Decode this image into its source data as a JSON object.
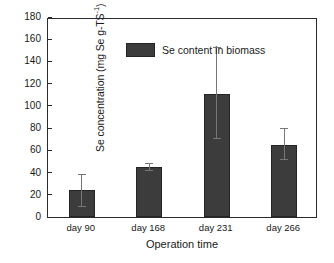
{
  "chart_data": {
    "type": "bar",
    "title": "",
    "xlabel": "Operation time",
    "ylabel": "Se concentration (mg Se g-TS",
    "ylabel_sup": "-1",
    "ylabel_tail": ")",
    "categories": [
      "day 90",
      "day 168",
      "day 231",
      "day 266"
    ],
    "series": [
      {
        "name": "Se content in biomass",
        "values": [
          24,
          45,
          111,
          65
        ],
        "err_low": [
          9,
          41,
          70,
          51
        ],
        "err_high": [
          39,
          49,
          153,
          80
        ]
      }
    ],
    "ylim": [
      0,
      180
    ],
    "ytick_step": 20,
    "yticks": [
      0,
      20,
      40,
      60,
      80,
      100,
      120,
      140,
      160,
      180
    ],
    "grid": false,
    "legend_position": "top-left-inside",
    "bar_color": "#3c3c3c",
    "bar_edge_color": "#242424",
    "error_color": "#767676",
    "axis_color": "#2b2b2b",
    "background": "#ffffff"
  },
  "legend": {
    "entries": [
      {
        "label": "Se content in biomass",
        "color": "#3c3c3c"
      }
    ]
  }
}
